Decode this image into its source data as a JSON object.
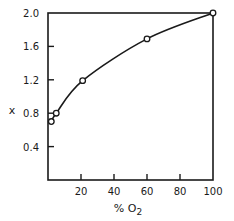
{
  "chart_data": {
    "type": "line",
    "title": "",
    "xlabel": "% O2",
    "ylabel": "x",
    "xlim": [
      0,
      100
    ],
    "ylim": [
      0,
      2.0
    ],
    "x_ticks": [
      20,
      40,
      60,
      80,
      100
    ],
    "x_tick_labels": [
      "20",
      "40",
      "60",
      "80",
      "100"
    ],
    "y_ticks": [
      0.4,
      0.8,
      1.2,
      1.6,
      2.0
    ],
    "y_tick_labels": [
      "0.4",
      "0.8",
      "1.2",
      "1.6",
      "2.0"
    ],
    "grid": false,
    "legend": null,
    "markers": "open-circle",
    "series": [
      {
        "name": "x vs % O2",
        "x": [
          2,
          5,
          21,
          60,
          100
        ],
        "y": [
          0.7,
          0.8,
          1.19,
          1.69,
          2.0
        ]
      }
    ],
    "colors": {
      "line": "#1a1a1a",
      "background": "#ffffff"
    }
  }
}
